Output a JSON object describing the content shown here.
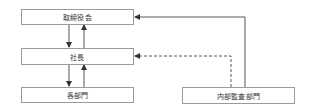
{
  "diagram": {
    "nodes": {
      "board": "取締役会",
      "president": "社長",
      "departments": "各部門",
      "internal_audit": "内部監査部門"
    },
    "edges": [
      {
        "from": "board",
        "to": "president",
        "style": "solid"
      },
      {
        "from": "president",
        "to": "board",
        "style": "solid"
      },
      {
        "from": "president",
        "to": "departments",
        "style": "solid"
      },
      {
        "from": "departments",
        "to": "president",
        "style": "solid"
      },
      {
        "from": "internal_audit",
        "to": "board",
        "style": "solid"
      },
      {
        "from": "internal_audit",
        "to": "president",
        "style": "dashed"
      }
    ],
    "colors": {
      "line": "#555555",
      "border": "#9a9a9a"
    }
  }
}
